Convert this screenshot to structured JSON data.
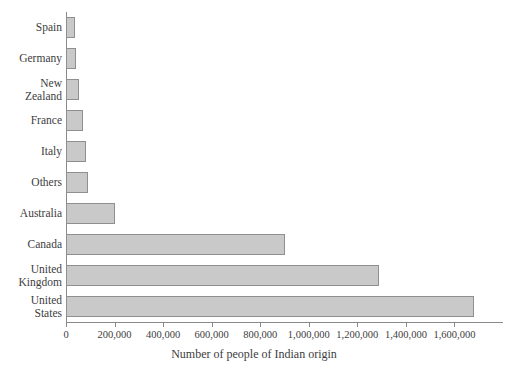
{
  "chart_data": {
    "type": "bar",
    "orientation": "horizontal",
    "title": "",
    "xlabel": "Number of people of Indian origin",
    "ylabel": "",
    "categories": [
      "Spain",
      "Germany",
      "New Zealand",
      "France",
      "Italy",
      "Others",
      "Australia",
      "Canada",
      "United Kingdom",
      "United States"
    ],
    "values": [
      38000,
      43000,
      55000,
      72000,
      81000,
      89000,
      200000,
      900000,
      1290000,
      1680000
    ],
    "xlim": [
      0,
      1800000
    ],
    "xticks": [
      0,
      200000,
      400000,
      600000,
      800000,
      1000000,
      1200000,
      1400000,
      1600000
    ],
    "xticklabels": [
      "0",
      "200,000",
      "400,000",
      "600,000",
      "800,000",
      "1,000,000",
      "1,200,000",
      "1,400,000",
      "1,600,000"
    ],
    "grid": false,
    "legend": null,
    "bar_color": "#c9c9c9",
    "bar_border_color": "#8f8f8f",
    "axis_color": "#8a8a8a",
    "text_color": "#3d3d3d"
  }
}
